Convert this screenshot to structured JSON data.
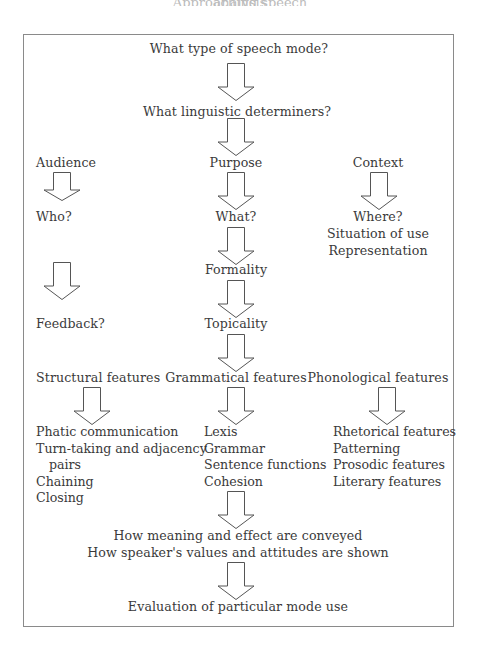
{
  "cropped_heading": "Approaching speech analysis",
  "diagram": {
    "top": {
      "q1": "What type of speech mode?",
      "q2": "What linguistic determiners?"
    },
    "columns": {
      "audience": {
        "heading": "Audience",
        "q": "Who?",
        "feedback": "Feedback?"
      },
      "purpose": {
        "heading": "Purpose",
        "q": "What?",
        "formality": "Formality",
        "topicality": "Topicality"
      },
      "context": {
        "heading": "Context",
        "q": "Where?",
        "lines": [
          "Situation of use",
          "Representation"
        ]
      }
    },
    "features": {
      "structural": {
        "heading": "Structural features",
        "items": [
          "Phatic communication",
          "Turn-taking and adjacency",
          "pairs",
          "Chaining",
          "Closing"
        ]
      },
      "grammatical": {
        "heading": "Grammatical features",
        "items": [
          "Lexis",
          "Grammar",
          "Sentence functions",
          "Cohesion"
        ]
      },
      "phonological": {
        "heading": "Phonological features",
        "items": [
          "Rhetorical features",
          "Patterning",
          "Prosodic features",
          "Literary features"
        ]
      }
    },
    "bottom": {
      "line1": "How meaning and effect are conveyed",
      "line2": "How speaker's values and attitudes are shown",
      "evaluation": "Evaluation of particular mode use"
    },
    "arrow_icon": "hollow-down-arrow",
    "colors": {
      "text": "#3a3a3a",
      "border": "#8a8a8a",
      "arrow_stroke": "#555555"
    }
  }
}
